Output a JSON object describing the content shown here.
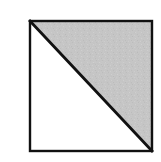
{
  "figure": {
    "name": "square-with-shaded-upper-right-triangle",
    "caption": "",
    "canvas": {
      "width": 161,
      "height": 162,
      "background_color": "#ffffff"
    },
    "colors": {
      "outline": "#111111",
      "diagonal": "#111111",
      "shaded_fill": "#c9c9c9",
      "unshaded_fill": "#ffffff",
      "texture_speckle": "#bdbdbd"
    },
    "square": {
      "label": "square-outline",
      "x": 30,
      "y": 21,
      "width": 122,
      "height": 130,
      "stroke_width": 2.4
    },
    "diagonal": {
      "label": "diagonal-line",
      "from": "top-left",
      "to": "bottom-right",
      "x1": 30,
      "y1": 21,
      "x2": 152,
      "y2": 151,
      "stroke_width": 2.8
    },
    "regions": [
      {
        "label": "upper-right-triangle",
        "state": "shaded",
        "fill": "#c9c9c9",
        "fraction_text": "1/2",
        "vertices": "30,21 152,21 152,151"
      },
      {
        "label": "lower-left-triangle",
        "state": "unshaded",
        "fill": "#ffffff",
        "fraction_text": "1/2",
        "vertices": "30,21 152,151 30,151"
      }
    ]
  }
}
